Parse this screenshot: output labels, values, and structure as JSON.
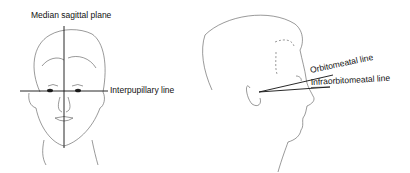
{
  "diagram": {
    "frontal_view": {
      "labels": {
        "vertical_line": "Median sagittal plane",
        "horizontal_line": "Interpupillary line"
      }
    },
    "lateral_view": {
      "labels": {
        "upper_line": "Orbitomeatal line",
        "lower_line": "Infraorbitomeatal line"
      }
    },
    "colors": {
      "line": "#111111",
      "sketch": "#555555",
      "background": "#ffffff"
    }
  }
}
